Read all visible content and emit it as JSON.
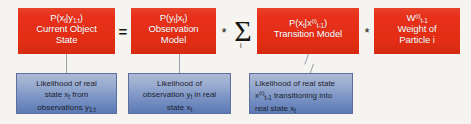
{
  "diagram": {
    "colors": {
      "term_red": "#e8301a",
      "note_blue_top": "#aeb9d5",
      "note_blue_bottom": "#5b79b4",
      "background": "#f6f4f1",
      "operator": "#16140f",
      "connector": "#9aa2ac"
    },
    "terms": [
      {
        "id": "posterior",
        "formula_prefix": "P(x",
        "formula_sub1": "t",
        "formula_mid": "|y",
        "formula_sub2": "1:t",
        "formula_suffix": ")",
        "label_line1": "Current Object",
        "label_line2": "State"
      },
      {
        "id": "observation",
        "formula_prefix": "P(y",
        "formula_sub1": "t",
        "formula_mid": "|x",
        "formula_sub2": "t",
        "formula_suffix": ")",
        "label_line1": "Observation",
        "label_line2": "Model"
      },
      {
        "id": "transition",
        "formula_prefix": "P(x",
        "formula_sub1": "t",
        "formula_mid": "|x",
        "formula_sup": "(i)",
        "formula_sub2": "t-1",
        "formula_suffix": ")",
        "label_line1": "Transition Model",
        "label_line2": ""
      },
      {
        "id": "weight",
        "formula_prefix": "W",
        "formula_sup": "(i)",
        "formula_sub2": "t-1",
        "label_line1": "Weight of",
        "label_line2": "Particle i"
      }
    ],
    "operators": {
      "equals": "=",
      "star1": "*",
      "star2": "*",
      "star3": "*",
      "sigma": "Σ",
      "sigma_index": "i"
    },
    "notes": [
      {
        "id": "note-posterior",
        "line1_a": "Likelihood of real",
        "line2_a": "state x",
        "line2_sub": "t",
        "line2_b": " from",
        "line3_a": "observations y",
        "line3_sub": "1:t"
      },
      {
        "id": "note-observation",
        "line1_a": "Likelihood of",
        "line2_a": "observation y",
        "line2_sub": "t",
        "line2_b": " in real",
        "line3_a": "state x",
        "line3_sub": "t"
      },
      {
        "id": "note-transition",
        "line1_a": "Likelihood of real state",
        "line2_a": "x",
        "line2_sup": "(i)",
        "line2_sub": "t-1",
        "line2_b": " transitioning into",
        "line3_a": "real state x",
        "line3_sub": "t"
      }
    ]
  }
}
